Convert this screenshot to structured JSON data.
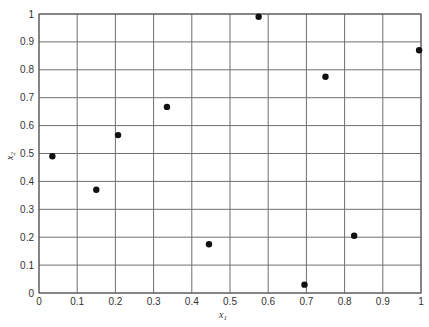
{
  "chart_data": {
    "type": "scatter",
    "title": "",
    "xlabel": "x1",
    "ylabel": "x2",
    "xlim": [
      0,
      1
    ],
    "ylim": [
      0,
      1
    ],
    "grid": true,
    "legend": null,
    "xticks": [
      "0",
      "0.1",
      "0.2",
      "0.3",
      "0.4",
      "0.5",
      "0.6",
      "0.7",
      "0.8",
      "0.9",
      "1"
    ],
    "yticks": [
      "0",
      "0.1",
      "0.2",
      "0.3",
      "0.4",
      "0.5",
      "0.6",
      "0.7",
      "0.8",
      "0.9",
      "1"
    ],
    "series": [
      {
        "name": "points",
        "color": "#111111",
        "x": [
          0.035,
          0.15,
          0.207,
          0.335,
          0.445,
          0.575,
          0.695,
          0.75,
          0.825,
          0.995
        ],
        "y": [
          0.49,
          0.37,
          0.566,
          0.667,
          0.175,
          0.99,
          0.03,
          0.775,
          0.205,
          0.87
        ]
      }
    ]
  },
  "labels": {
    "xlabel_main": "x",
    "xlabel_sub": "1",
    "ylabel_main": "x",
    "ylabel_sub": "2"
  },
  "colors": {
    "grid": "#6f6f6f",
    "point": "#111111",
    "background": "#ffffff"
  }
}
